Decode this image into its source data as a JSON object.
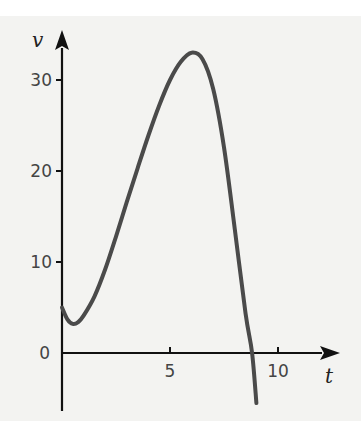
{
  "chart_data": {
    "type": "line",
    "title": "",
    "xlabel": "t",
    "ylabel": "v",
    "xlim": [
      -0.2,
      12.5
    ],
    "ylim": [
      -6,
      36
    ],
    "x_ticks": [
      5,
      10
    ],
    "y_ticks": [
      0,
      10,
      20,
      30
    ],
    "x_tick_labels": [
      "5",
      "10"
    ],
    "y_tick_labels": [
      "0",
      "10",
      "20",
      "30"
    ],
    "grid": false,
    "legend": "none",
    "series": [
      {
        "name": "v(t)",
        "color": "#4a4a4a",
        "x": [
          0,
          0.25,
          0.5,
          0.75,
          1.0,
          1.5,
          2.0,
          2.5,
          3.0,
          3.5,
          4.0,
          4.5,
          5.0,
          5.5,
          6.0,
          6.5,
          7.0,
          7.5,
          8.0,
          8.5,
          8.8,
          9.0
        ],
        "y": [
          5.0,
          3.7,
          3.2,
          3.4,
          4.1,
          6.2,
          9.2,
          12.8,
          16.6,
          20.3,
          23.9,
          27.2,
          30.0,
          32.0,
          33.0,
          32.3,
          29.0,
          22.6,
          13.6,
          4.3,
          0,
          -5.5
        ]
      }
    ]
  }
}
